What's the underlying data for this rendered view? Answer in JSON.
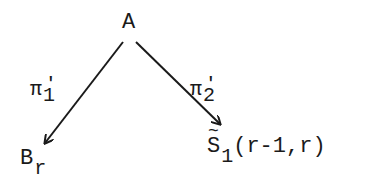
{
  "diagram": {
    "type": "commutative-diagram",
    "nodes": {
      "top": {
        "label": "A"
      },
      "bottom_left": {
        "base": "B",
        "subscript": "r"
      },
      "bottom_right": {
        "accent": "~",
        "base": "S",
        "subscript": "1",
        "args": "(r-1,r)"
      }
    },
    "edges": [
      {
        "from": "A",
        "to": "B_r",
        "label": {
          "symbol": "π",
          "prime": "'",
          "subscript": "1"
        }
      },
      {
        "from": "A",
        "to": "S~_1(r-1,r)",
        "label": {
          "symbol": "π",
          "prime": "'",
          "subscript": "2"
        }
      }
    ],
    "colors": {
      "ink": "#1a1a1a",
      "background": "#ffffff"
    }
  }
}
